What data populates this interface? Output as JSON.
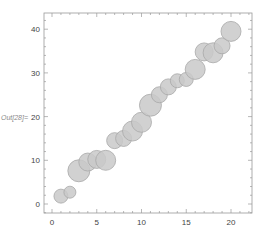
{
  "chart_data": {
    "type": "scatter",
    "subtype": "bubble",
    "title": "",
    "xlabel": "",
    "ylabel": "Out[28]=",
    "xlim": [
      -1.5,
      22
    ],
    "ylim": [
      -2,
      43
    ],
    "x_ticks": [
      0,
      5,
      10,
      15,
      20
    ],
    "y_ticks": [
      0,
      10,
      20,
      30,
      40
    ],
    "grid": false,
    "legend": null,
    "series": [
      {
        "name": "data",
        "color": "#c9c9c9",
        "points": [
          {
            "x": 1,
            "y": 1.8,
            "size": 7
          },
          {
            "x": 2,
            "y": 2.7,
            "size": 6
          },
          {
            "x": 3,
            "y": 7.6,
            "size": 11
          },
          {
            "x": 4,
            "y": 9.6,
            "size": 9
          },
          {
            "x": 5,
            "y": 10.2,
            "size": 9
          },
          {
            "x": 6,
            "y": 10.0,
            "size": 10
          },
          {
            "x": 7,
            "y": 14.5,
            "size": 8
          },
          {
            "x": 8,
            "y": 15.0,
            "size": 8
          },
          {
            "x": 9,
            "y": 16.7,
            "size": 10
          },
          {
            "x": 10,
            "y": 18.7,
            "size": 10
          },
          {
            "x": 11,
            "y": 22.6,
            "size": 11
          },
          {
            "x": 12,
            "y": 25.0,
            "size": 8
          },
          {
            "x": 13,
            "y": 26.8,
            "size": 8
          },
          {
            "x": 14,
            "y": 28.2,
            "size": 7
          },
          {
            "x": 15,
            "y": 28.5,
            "size": 7
          },
          {
            "x": 16,
            "y": 30.8,
            "size": 10
          },
          {
            "x": 17,
            "y": 34.8,
            "size": 9
          },
          {
            "x": 18,
            "y": 34.6,
            "size": 10
          },
          {
            "x": 19,
            "y": 36.2,
            "size": 8
          },
          {
            "x": 20,
            "y": 39.5,
            "size": 10
          }
        ]
      }
    ]
  },
  "labels": {
    "out_label": "Out[28]=",
    "x_tick_labels": [
      "0",
      "5",
      "10",
      "15",
      "20"
    ],
    "y_tick_labels": [
      "0",
      "10",
      "20",
      "30",
      "40"
    ]
  }
}
